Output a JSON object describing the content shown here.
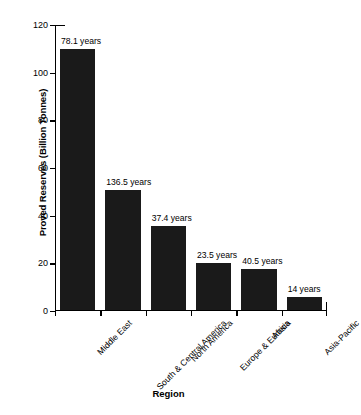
{
  "chart_data": {
    "type": "bar",
    "title": "",
    "xlabel": "Region",
    "ylabel": "Proved Reserves (Billion Tonnes)",
    "categories": [
      "Middle East",
      "South & Central America",
      "North America",
      "Europe & Eurasia",
      "Africa",
      "Asia-Pacific"
    ],
    "values": [
      110.0,
      50.6,
      35.5,
      20.3,
      17.6,
      5.8
    ],
    "point_labels": [
      "78.1 years",
      "136.5 years",
      "37.4 years",
      "23.5 years",
      "40.5 years",
      "14 years"
    ],
    "ylim": [
      0,
      120
    ],
    "yticks": [
      0,
      20,
      40,
      60,
      80,
      100,
      120
    ],
    "ytick_labels": [
      "0",
      "20",
      "40",
      "60",
      "80",
      "100",
      "120"
    ],
    "grid": false,
    "legend": null,
    "bar_color": "#1a1a1a",
    "axis_color": "#000000",
    "background_color": "#ffffff"
  }
}
